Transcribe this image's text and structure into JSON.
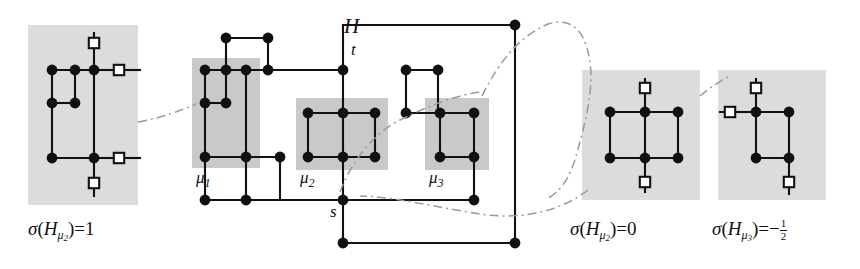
{
  "figure": {
    "title_label": "H",
    "source_label": "s",
    "sink_label": "t",
    "colors": {
      "node_fill": "#111111",
      "edge": "#111111",
      "panel_bg": "#dcdcdc",
      "highlight_bg": "#c9c9c9",
      "square_fill": "#ffffff",
      "dashdot": "#9a9a9a"
    }
  },
  "panels": [
    {
      "id": "panel-left",
      "caption_sigma": "σ",
      "caption_open": "(",
      "caption_H": "H",
      "caption_mu": "μ",
      "caption_mu_index": "2",
      "caption_close": ")",
      "caption_eq": "=",
      "caption_value": "1"
    },
    {
      "id": "panel-right-1",
      "caption_sigma": "σ",
      "caption_open": "(",
      "caption_H": "H",
      "caption_mu": "μ",
      "caption_mu_index": "2",
      "caption_close": ")",
      "caption_eq": "=",
      "caption_value": "0"
    },
    {
      "id": "panel-right-2",
      "caption_sigma": "σ",
      "caption_open": "(",
      "caption_H": "H",
      "caption_mu": "μ",
      "caption_mu_index": "3",
      "caption_close": ")",
      "caption_eq": "=",
      "caption_value": "−",
      "caption_fraction_num": "1",
      "caption_fraction_den": "2"
    }
  ],
  "components": [
    {
      "id": "mu1",
      "label_mu": "μ",
      "label_index": "1"
    },
    {
      "id": "mu2",
      "label_mu": "μ",
      "label_index": "2"
    },
    {
      "id": "mu3",
      "label_mu": "μ",
      "label_index": "3"
    }
  ],
  "graph_left": {
    "background": {
      "x": 28,
      "y": 25,
      "w": 110,
      "h": 180
    },
    "nodes": [
      {
        "x": 52,
        "y": 70
      },
      {
        "x": 75,
        "y": 70
      },
      {
        "x": 94,
        "y": 70
      },
      {
        "x": 52,
        "y": 103
      },
      {
        "x": 75,
        "y": 103
      },
      {
        "x": 52,
        "y": 158
      },
      {
        "x": 94,
        "y": 158
      }
    ],
    "squares": [
      {
        "x": 94,
        "y": 43
      },
      {
        "x": 119,
        "y": 70
      },
      {
        "x": 119,
        "y": 158
      },
      {
        "x": 94,
        "y": 183
      }
    ],
    "edges": [
      [
        52,
        70,
        94,
        70
      ],
      [
        52,
        103,
        75,
        103
      ],
      [
        52,
        70,
        52,
        158
      ],
      [
        75,
        70,
        75,
        103
      ],
      [
        94,
        46,
        94,
        158
      ],
      [
        52,
        158,
        94,
        158
      ],
      [
        94,
        70,
        116,
        70
      ],
      [
        94,
        158,
        116,
        158
      ],
      [
        94,
        158,
        94,
        180
      ],
      [
        94,
        186,
        94,
        196
      ],
      [
        122,
        70,
        140,
        70
      ],
      [
        122,
        158,
        140,
        158
      ],
      [
        94,
        33,
        94,
        40
      ]
    ]
  },
  "graph_main": {
    "backgrounds": [
      {
        "id": "mu1-bg",
        "x": 192,
        "y": 58,
        "w": 68,
        "h": 110
      },
      {
        "id": "mu2-bg",
        "x": 296,
        "y": 98,
        "w": 92,
        "h": 72
      },
      {
        "id": "mu3-bg",
        "x": 425,
        "y": 98,
        "w": 64,
        "h": 72
      }
    ],
    "nodes": [
      {
        "x": 515,
        "y": 25
      },
      {
        "x": 226,
        "y": 38
      },
      {
        "x": 268,
        "y": 38
      },
      {
        "x": 205,
        "y": 70
      },
      {
        "x": 226,
        "y": 70
      },
      {
        "x": 246,
        "y": 70
      },
      {
        "x": 268,
        "y": 70
      },
      {
        "x": 343,
        "y": 70
      },
      {
        "x": 205,
        "y": 103
      },
      {
        "x": 226,
        "y": 103
      },
      {
        "x": 406,
        "y": 70
      },
      {
        "x": 438,
        "y": 70
      },
      {
        "x": 308,
        "y": 113
      },
      {
        "x": 343,
        "y": 113
      },
      {
        "x": 375,
        "y": 113
      },
      {
        "x": 406,
        "y": 113
      },
      {
        "x": 440,
        "y": 113
      },
      {
        "x": 474,
        "y": 113
      },
      {
        "x": 205,
        "y": 157
      },
      {
        "x": 246,
        "y": 157
      },
      {
        "x": 280,
        "y": 157
      },
      {
        "x": 308,
        "y": 157
      },
      {
        "x": 343,
        "y": 157
      },
      {
        "x": 375,
        "y": 157
      },
      {
        "x": 440,
        "y": 157
      },
      {
        "x": 474,
        "y": 157
      },
      {
        "x": 205,
        "y": 200
      },
      {
        "x": 246,
        "y": 200
      },
      {
        "x": 343,
        "y": 200
      },
      {
        "x": 474,
        "y": 200
      },
      {
        "x": 343,
        "y": 243
      },
      {
        "x": 515,
        "y": 243
      }
    ],
    "edges": [
      [
        205,
        70,
        343,
        70
      ],
      [
        226,
        38,
        268,
        38
      ],
      [
        226,
        38,
        226,
        70
      ],
      [
        268,
        38,
        268,
        70
      ],
      [
        343,
        25,
        343,
        70
      ],
      [
        343,
        25,
        515,
        25
      ],
      [
        205,
        103,
        226,
        103
      ],
      [
        205,
        70,
        205,
        157
      ],
      [
        226,
        70,
        226,
        103
      ],
      [
        246,
        70,
        246,
        200
      ],
      [
        205,
        157,
        280,
        157
      ],
      [
        280,
        157,
        280,
        200
      ],
      [
        205,
        157,
        205,
        200
      ],
      [
        205,
        200,
        343,
        200
      ],
      [
        308,
        113,
        375,
        113
      ],
      [
        308,
        157,
        375,
        157
      ],
      [
        308,
        113,
        308,
        157
      ],
      [
        375,
        113,
        375,
        157
      ],
      [
        343,
        70,
        343,
        243
      ],
      [
        406,
        70,
        438,
        70
      ],
      [
        406,
        70,
        406,
        113
      ],
      [
        438,
        70,
        438,
        113
      ],
      [
        406,
        113,
        474,
        113
      ],
      [
        440,
        113,
        440,
        157
      ],
      [
        474,
        113,
        474,
        200
      ],
      [
        440,
        157,
        474,
        157
      ],
      [
        343,
        200,
        474,
        200
      ],
      [
        343,
        243,
        515,
        243
      ],
      [
        515,
        25,
        515,
        243
      ]
    ]
  },
  "graph_right_1": {
    "background": {
      "x": 582,
      "y": 70,
      "w": 118,
      "h": 130
    },
    "nodes": [
      {
        "x": 610,
        "y": 112
      },
      {
        "x": 645,
        "y": 112
      },
      {
        "x": 678,
        "y": 112
      },
      {
        "x": 610,
        "y": 158
      },
      {
        "x": 645,
        "y": 158
      },
      {
        "x": 678,
        "y": 158
      }
    ],
    "squares": [
      {
        "x": 645,
        "y": 88
      },
      {
        "x": 645,
        "y": 182
      }
    ],
    "edges": [
      [
        610,
        112,
        678,
        112
      ],
      [
        610,
        158,
        678,
        158
      ],
      [
        610,
        112,
        610,
        158
      ],
      [
        645,
        112,
        645,
        158
      ],
      [
        678,
        112,
        678,
        158
      ],
      [
        645,
        91,
        645,
        112
      ],
      [
        645,
        158,
        645,
        179
      ],
      [
        645,
        79,
        645,
        85
      ],
      [
        645,
        185,
        645,
        192
      ]
    ]
  },
  "graph_right_2": {
    "background": {
      "x": 718,
      "y": 70,
      "w": 108,
      "h": 130
    },
    "nodes": [
      {
        "x": 756,
        "y": 112
      },
      {
        "x": 789,
        "y": 112
      },
      {
        "x": 756,
        "y": 158
      },
      {
        "x": 789,
        "y": 158
      }
    ],
    "squares": [
      {
        "x": 756,
        "y": 88
      },
      {
        "x": 730,
        "y": 112
      },
      {
        "x": 789,
        "y": 182
      }
    ],
    "edges": [
      [
        756,
        112,
        789,
        112
      ],
      [
        756,
        158,
        789,
        158
      ],
      [
        756,
        112,
        756,
        158
      ],
      [
        789,
        112,
        789,
        158
      ],
      [
        756,
        91,
        756,
        112
      ],
      [
        733,
        112,
        756,
        112
      ],
      [
        789,
        158,
        789,
        179
      ],
      [
        756,
        79,
        756,
        85
      ],
      [
        720,
        112,
        727,
        112
      ],
      [
        789,
        185,
        789,
        194
      ]
    ]
  },
  "dashdot_paths": [
    "M 138 122 C 160 118, 178 112, 196 104",
    "M 482 96 C 500 60, 520 36, 548 24 C 574 16, 586 34, 590 62 C 594 92, 584 128, 576 156 C 570 178, 560 192, 548 198",
    "M 588 190 C 560 212, 520 220, 480 214 C 430 206, 390 196, 360 196",
    "M 700 96 C 712 86, 722 80, 730 76",
    "M 340 192 C 348 170, 368 136, 400 120 C 440 100, 470 92, 484 92"
  ]
}
